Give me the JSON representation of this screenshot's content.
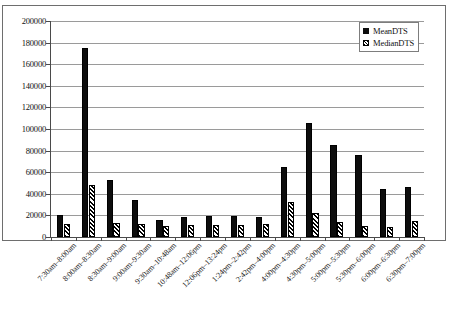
{
  "chart_data": {
    "type": "bar",
    "title": "",
    "xlabel": "",
    "ylabel": "",
    "ylim": [
      0,
      200000
    ],
    "ytick_step": 20000,
    "yticks": [
      0,
      20000,
      40000,
      60000,
      80000,
      100000,
      120000,
      140000,
      160000,
      180000,
      200000
    ],
    "ytick_labels": [
      "0",
      "20000",
      "40000",
      "60000",
      "80000",
      "100000",
      "120000",
      "140000",
      "160000",
      "180000",
      "200000"
    ],
    "grid": true,
    "grid_axis": "y",
    "legend_position": "top-right",
    "categories": [
      "7:30am–8:00am",
      "8:00am–8:30am",
      "8:30am–9:00am",
      "9:00am–9:30am",
      "9:30am–10:48am",
      "10:48am–12:06pm",
      "12:06pm–13:24pm",
      "1:24pm–2:42pm",
      "2:42pm–4:00pm",
      "4:00pm–4:30pm",
      "4:30pm–5:00pm",
      "5:00pm–5:30pm",
      "5:30pm–6:00pm",
      "6:00pm–6:30pm",
      "6:30pm–7:00pm"
    ],
    "series": [
      {
        "name": "MeanDTS",
        "color": "#0d0d0d",
        "fill": "solid",
        "values": [
          20800,
          175000,
          52500,
          34000,
          15500,
          18200,
          19500,
          19000,
          18200,
          65000,
          105500,
          85500,
          76000,
          44500,
          46500
        ]
      },
      {
        "name": "MedianDTS",
        "color": "#000000",
        "fill": "diagonal-hatch",
        "values": [
          12200,
          48500,
          12800,
          12500,
          10000,
          11200,
          11000,
          11000,
          12000,
          32500,
          22000,
          14000,
          10200,
          9000,
          14500
        ]
      }
    ]
  },
  "legend": {
    "items": [
      {
        "label": "MeanDTS",
        "swatch": "solid-square-icon"
      },
      {
        "label": "MedianDTS",
        "swatch": "hatched-square-icon"
      }
    ]
  }
}
